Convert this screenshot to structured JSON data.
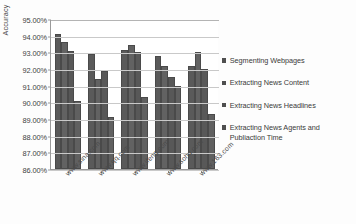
{
  "chart_data": {
    "type": "bar",
    "title": "",
    "xlabel": "",
    "ylabel": "Accuracy",
    "ylim": [
      86.0,
      95.0
    ],
    "ytick_labels": [
      "95.00%",
      "94.00%",
      "93.00%",
      "92.00%",
      "91.00%",
      "90.00%",
      "89.00%",
      "88.00%",
      "87.00%",
      "86.00%"
    ],
    "ytick_values": [
      95.0,
      94.0,
      93.0,
      92.0,
      91.0,
      90.0,
      89.0,
      88.0,
      87.0,
      86.0
    ],
    "grid": true,
    "legend_position": "right",
    "categories": [
      "www.sina.com",
      "www.qq.com",
      "www.ifeng.com",
      "www.sohu.com",
      "www.163.com"
    ],
    "series": [
      {
        "name": "Segmenting Webpages",
        "values": [
          94.1,
          92.9,
          93.15,
          92.8,
          92.2
        ]
      },
      {
        "name": "Extracting News Content",
        "values": [
          93.6,
          91.4,
          93.45,
          92.2,
          93.0
        ]
      },
      {
        "name": "Extracting News Headlines",
        "values": [
          93.1,
          91.9,
          93.0,
          91.5,
          92.0
        ]
      },
      {
        "name": "Extracting News Agents and Publiaction Time",
        "values": [
          90.1,
          89.1,
          90.35,
          91.0,
          89.3
        ]
      }
    ]
  },
  "legend": {
    "items": [
      {
        "label": "Segmenting Webpages"
      },
      {
        "label": "Extracting News Content"
      },
      {
        "label": "Extracting News Headlines"
      },
      {
        "label": "Extracting News Agents and Publiaction Time"
      }
    ]
  }
}
